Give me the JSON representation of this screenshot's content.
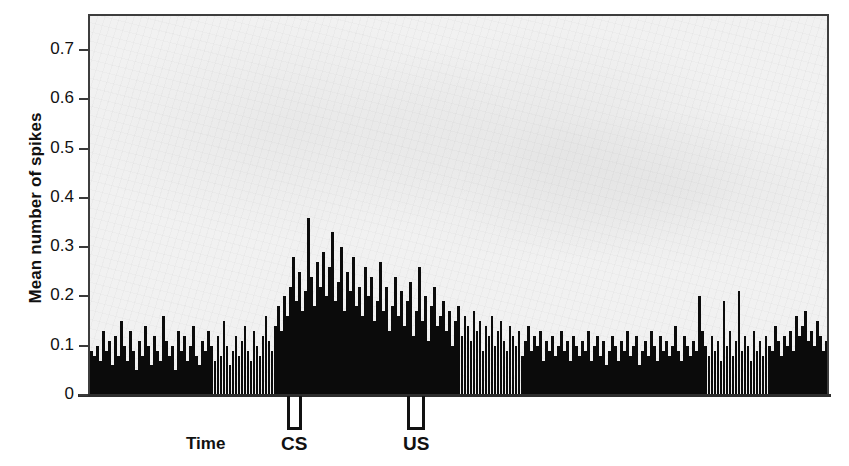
{
  "chart_data": {
    "type": "bar",
    "title": "",
    "subtitle": "",
    "xlabel": "Time",
    "ylabel": "Mean number of spikes",
    "ylim": [
      0,
      0.75
    ],
    "ytick_labels": [
      "0.7",
      "0.6",
      "0.5",
      "0.4",
      "0.3",
      "0.2",
      "0.1",
      "0"
    ],
    "ytick_values": [
      0.7,
      0.6,
      0.5,
      0.4,
      0.3,
      0.2,
      0.1,
      0
    ],
    "xtick_labels": [],
    "grid": false,
    "legend": null,
    "bar_color": "#0b0b0b",
    "plot_background": "#f1f1f1",
    "annotations": [
      {
        "name": "CS",
        "label": "CS",
        "bin_start": 66,
        "bin_end": 71,
        "note": "conditioned stimulus marker bracket below axis"
      },
      {
        "name": "US",
        "label": "US",
        "bin_start": 106,
        "bin_end": 112,
        "note": "unconditioned stimulus marker bracket below axis"
      }
    ],
    "n_bins": 246,
    "values": [
      0.09,
      0.08,
      0.1,
      0.07,
      0.13,
      0.09,
      0.11,
      0.06,
      0.12,
      0.08,
      0.15,
      0.1,
      0.07,
      0.13,
      0.09,
      0.05,
      0.11,
      0.08,
      0.14,
      0.1,
      0.06,
      0.12,
      0.09,
      0.07,
      0.16,
      0.11,
      0.08,
      0.1,
      0.05,
      0.13,
      0.09,
      0.12,
      0.07,
      0.1,
      0.14,
      0.08,
      0.06,
      0.11,
      0.09,
      0.13,
      0.1,
      0.07,
      0.12,
      0.08,
      0.15,
      0.1,
      0.06,
      0.09,
      0.12,
      0.08,
      0.11,
      0.14,
      0.09,
      0.07,
      0.13,
      0.1,
      0.08,
      0.12,
      0.16,
      0.11,
      0.09,
      0.14,
      0.18,
      0.13,
      0.2,
      0.16,
      0.22,
      0.28,
      0.19,
      0.25,
      0.17,
      0.21,
      0.36,
      0.24,
      0.18,
      0.27,
      0.22,
      0.29,
      0.2,
      0.26,
      0.33,
      0.19,
      0.23,
      0.3,
      0.17,
      0.25,
      0.21,
      0.28,
      0.18,
      0.22,
      0.16,
      0.26,
      0.2,
      0.24,
      0.15,
      0.19,
      0.27,
      0.17,
      0.22,
      0.13,
      0.18,
      0.24,
      0.16,
      0.21,
      0.14,
      0.19,
      0.23,
      0.12,
      0.17,
      0.26,
      0.15,
      0.2,
      0.11,
      0.18,
      0.22,
      0.14,
      0.16,
      0.19,
      0.13,
      0.17,
      0.1,
      0.15,
      0.18,
      0.12,
      0.16,
      0.14,
      0.11,
      0.17,
      0.13,
      0.15,
      0.09,
      0.14,
      0.12,
      0.16,
      0.1,
      0.13,
      0.15,
      0.11,
      0.09,
      0.14,
      0.12,
      0.1,
      0.13,
      0.08,
      0.11,
      0.14,
      0.09,
      0.12,
      0.1,
      0.13,
      0.07,
      0.11,
      0.09,
      0.12,
      0.08,
      0.1,
      0.13,
      0.09,
      0.11,
      0.07,
      0.12,
      0.1,
      0.08,
      0.11,
      0.09,
      0.13,
      0.07,
      0.1,
      0.12,
      0.08,
      0.11,
      0.06,
      0.09,
      0.12,
      0.1,
      0.07,
      0.11,
      0.09,
      0.13,
      0.08,
      0.1,
      0.12,
      0.06,
      0.09,
      0.11,
      0.08,
      0.13,
      0.1,
      0.07,
      0.12,
      0.09,
      0.11,
      0.08,
      0.1,
      0.14,
      0.09,
      0.07,
      0.12,
      0.1,
      0.08,
      0.11,
      0.09,
      0.2,
      0.13,
      0.1,
      0.08,
      0.12,
      0.09,
      0.11,
      0.07,
      0.19,
      0.1,
      0.13,
      0.08,
      0.11,
      0.21,
      0.09,
      0.12,
      0.1,
      0.07,
      0.13,
      0.09,
      0.11,
      0.08,
      0.12,
      0.1,
      0.09,
      0.14,
      0.11,
      0.08,
      0.12,
      0.1,
      0.13,
      0.09,
      0.16,
      0.12,
      0.14,
      0.17,
      0.11,
      0.13,
      0.1,
      0.15,
      0.12,
      0.09,
      0.11,
      0.08
    ]
  },
  "axis": {
    "ylabel_text": "Mean number of spikes",
    "xlabel_text": "Time"
  },
  "events": {
    "cs_label": "CS",
    "us_label": "US"
  }
}
